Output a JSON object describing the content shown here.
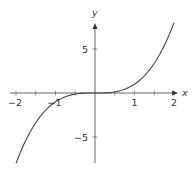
{
  "chart_data": {
    "type": "line",
    "title": "",
    "function": "y = x^3",
    "xlabel": "x",
    "ylabel": "y",
    "xlim": [
      -2,
      2
    ],
    "ylim": [
      -8,
      8
    ],
    "grid": false,
    "legend": null,
    "x_ticks": [
      -2,
      -1.5,
      -1,
      -0.5,
      0.5,
      1,
      1.5,
      2
    ],
    "x_tick_labels": [
      {
        "value": -2,
        "label": "−2"
      },
      {
        "value": -1,
        "label": "−1"
      },
      {
        "value": 1,
        "label": "1"
      },
      {
        "value": 2,
        "label": "2"
      }
    ],
    "y_ticks": [
      -5,
      5
    ],
    "y_tick_labels": [
      {
        "value": 5,
        "label": "5"
      },
      {
        "value": -5,
        "label": "−5"
      }
    ],
    "series": [
      {
        "name": "x^3",
        "x": [
          -2,
          -1.75,
          -1.5,
          -1.25,
          -1,
          -0.75,
          -0.5,
          -0.25,
          0,
          0.25,
          0.5,
          0.75,
          1,
          1.25,
          1.5,
          1.75,
          2
        ],
        "y": [
          -8,
          -5.36,
          -3.375,
          -1.953,
          -1,
          -0.422,
          -0.125,
          -0.016,
          0,
          0.016,
          0.125,
          0.422,
          1,
          1.953,
          3.375,
          5.36,
          8
        ]
      }
    ],
    "colors": {
      "curve": "#444444",
      "axes": "#555555"
    }
  },
  "layout": {
    "origin_px": [
      95,
      93
    ],
    "x_unit_px": 39.5,
    "y_unit_px": 8.8
  }
}
